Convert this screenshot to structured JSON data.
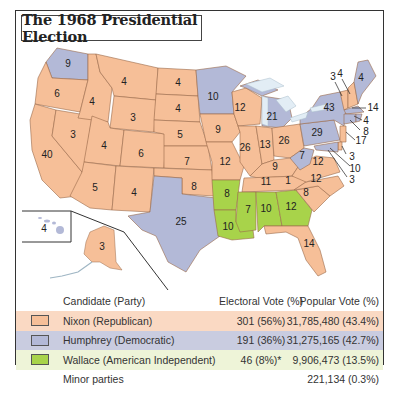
{
  "title": "The 1968 Presidential Election",
  "colors": {
    "nixon": "#f6bf98",
    "humphrey": "#b3b9d7",
    "wallace": "#a8d34a",
    "border": "#8a5a3a",
    "nixon_row": "#fad9c3",
    "humphrey_row": "#c9cce0",
    "wallace_row": "#eef4d8"
  },
  "map": {
    "states": [
      {
        "name": "WA",
        "ev": "9",
        "party": "humphrey"
      },
      {
        "name": "OR",
        "ev": "6",
        "party": "nixon"
      },
      {
        "name": "CA",
        "ev": "40",
        "party": "nixon"
      },
      {
        "name": "ID",
        "ev": "4",
        "party": "nixon"
      },
      {
        "name": "NV",
        "ev": "3",
        "party": "nixon"
      },
      {
        "name": "MT",
        "ev": "4",
        "party": "nixon"
      },
      {
        "name": "WY",
        "ev": "3",
        "party": "nixon"
      },
      {
        "name": "UT",
        "ev": "4",
        "party": "nixon"
      },
      {
        "name": "AZ",
        "ev": "5",
        "party": "nixon"
      },
      {
        "name": "CO",
        "ev": "6",
        "party": "nixon"
      },
      {
        "name": "NM",
        "ev": "4",
        "party": "nixon"
      },
      {
        "name": "ND",
        "ev": "4",
        "party": "nixon"
      },
      {
        "name": "SD",
        "ev": "4",
        "party": "nixon"
      },
      {
        "name": "NE",
        "ev": "5",
        "party": "nixon"
      },
      {
        "name": "KS",
        "ev": "7",
        "party": "nixon"
      },
      {
        "name": "OK",
        "ev": "8",
        "party": "nixon"
      },
      {
        "name": "TX",
        "ev": "25",
        "party": "humphrey"
      },
      {
        "name": "MN",
        "ev": "10",
        "party": "humphrey"
      },
      {
        "name": "IA",
        "ev": "9",
        "party": "nixon"
      },
      {
        "name": "MO",
        "ev": "12",
        "party": "nixon"
      },
      {
        "name": "AR",
        "ev": "8",
        "party": "wallace"
      },
      {
        "name": "LA",
        "ev": "10",
        "party": "wallace"
      },
      {
        "name": "WI",
        "ev": "12",
        "party": "nixon"
      },
      {
        "name": "IL",
        "ev": "26",
        "party": "nixon"
      },
      {
        "name": "MI",
        "ev": "21",
        "party": "humphrey"
      },
      {
        "name": "IN",
        "ev": "13",
        "party": "nixon"
      },
      {
        "name": "OH",
        "ev": "26",
        "party": "nixon"
      },
      {
        "name": "KY",
        "ev": "9",
        "party": "nixon"
      },
      {
        "name": "TN",
        "ev": "11",
        "party": "nixon"
      },
      {
        "name": "MS",
        "ev": "7",
        "party": "wallace"
      },
      {
        "name": "AL",
        "ev": "10",
        "party": "wallace"
      },
      {
        "name": "GA",
        "ev": "12",
        "party": "wallace"
      },
      {
        "name": "FL",
        "ev": "14",
        "party": "nixon"
      },
      {
        "name": "SC",
        "ev": "8",
        "party": "nixon"
      },
      {
        "name": "NC",
        "ev": "12",
        "party": "nixon"
      },
      {
        "name": "NC-faithless",
        "ev": "1",
        "party": "wallace"
      },
      {
        "name": "VA",
        "ev": "12",
        "party": "nixon"
      },
      {
        "name": "WV",
        "ev": "7",
        "party": "humphrey"
      },
      {
        "name": "PA",
        "ev": "29",
        "party": "humphrey"
      },
      {
        "name": "NY",
        "ev": "43",
        "party": "humphrey"
      },
      {
        "name": "VT",
        "ev": "3",
        "party": "nixon"
      },
      {
        "name": "NH",
        "ev": "4",
        "party": "nixon"
      },
      {
        "name": "ME",
        "ev": "4",
        "party": "humphrey"
      },
      {
        "name": "MA",
        "ev": "14",
        "party": "humphrey"
      },
      {
        "name": "RI",
        "ev": "4",
        "party": "humphrey"
      },
      {
        "name": "CT",
        "ev": "8",
        "party": "humphrey"
      },
      {
        "name": "NJ",
        "ev": "17",
        "party": "nixon"
      },
      {
        "name": "DE",
        "ev": "3",
        "party": "nixon"
      },
      {
        "name": "MD",
        "ev": "10",
        "party": "humphrey"
      },
      {
        "name": "DC",
        "ev": "3",
        "party": "humphrey"
      },
      {
        "name": "HI",
        "ev": "4",
        "party": "humphrey"
      },
      {
        "name": "AK",
        "ev": "3",
        "party": "nixon"
      }
    ]
  },
  "legend": {
    "headers": {
      "candidate": "Candidate (Party)",
      "electoral": "Electoral Vote (%)",
      "popular": "Popular Vote (%)"
    },
    "rows": [
      {
        "candidate": "Nixon (Republican)",
        "electoral": "301 (56%)",
        "popular": "31,785,480 (43.4%)"
      },
      {
        "candidate": "Humphrey (Democratic)",
        "electoral": "191 (36%)",
        "popular": "31,275,165 (42.7%)"
      },
      {
        "candidate": "Wallace (American Independent)",
        "electoral": "46 (8%)*",
        "popular": "9,906,473 (13.5%)"
      },
      {
        "candidate": "Minor parties",
        "electoral": "",
        "popular": "221,134 (0.3%)"
      }
    ]
  }
}
